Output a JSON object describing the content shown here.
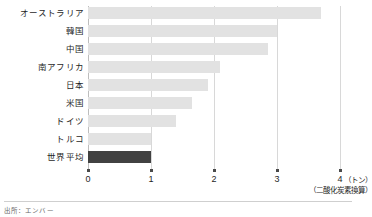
{
  "chart_data": {
    "type": "bar",
    "orientation": "horizontal",
    "title": "",
    "subtitle": "",
    "xlabel": "4（トン）",
    "xlabel_secondary": "（二酸化炭素換算）",
    "ylabel": "",
    "categories": [
      "オーストラリア",
      "韓国",
      "中国",
      "南アフリカ",
      "日本",
      "米国",
      "ドイツ",
      "トルコ",
      "世界平均"
    ],
    "values": [
      3.7,
      3.0,
      2.85,
      2.1,
      1.9,
      1.65,
      1.4,
      1.0,
      1.0
    ],
    "highlight_index": 8,
    "xlim": [
      0,
      4
    ],
    "xticks": [
      0,
      1,
      2,
      3,
      4
    ],
    "xtick_labels": [
      "0",
      "1",
      "2",
      "3",
      "4"
    ],
    "grid": true,
    "grid_axis": "x",
    "legend": "none"
  },
  "axis": {
    "unit_label": "（トン）",
    "unit_sublabel": "（二酸化炭素換算）"
  },
  "footer": {
    "source": "出所：エンバー"
  },
  "colors": {
    "bar": "#e2e2e2",
    "bar_highlight": "#414141",
    "gridline": "#d8d8d8",
    "axis_text": "#1f1f1f",
    "source_text": "#6a6a6a",
    "background": "#ffffff"
  }
}
